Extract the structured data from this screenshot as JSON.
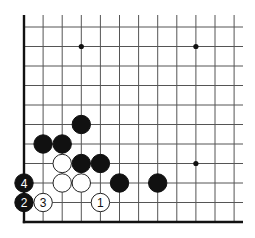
{
  "diagram": {
    "type": "go-board-fragment",
    "corner": "bottom-left",
    "columns_visible": 12,
    "rows_visible": 11,
    "grid": {
      "x0": 24,
      "dx": 19.1,
      "y0": 27,
      "dy": 19.5,
      "top_extent": 15,
      "right_extent": 243
    },
    "edges": [
      "left",
      "bottom"
    ],
    "star_points": [
      {
        "col": 3,
        "row": 1
      },
      {
        "col": 9,
        "row": 1
      },
      {
        "col": 9,
        "row": 7
      }
    ],
    "stones": [
      {
        "color": "black",
        "col": 3,
        "row": 5,
        "label": ""
      },
      {
        "color": "black",
        "col": 1,
        "row": 6,
        "label": ""
      },
      {
        "color": "black",
        "col": 2,
        "row": 6,
        "label": ""
      },
      {
        "color": "white",
        "col": 2,
        "row": 7,
        "label": ""
      },
      {
        "color": "black",
        "col": 3,
        "row": 7,
        "label": ""
      },
      {
        "color": "black",
        "col": 4,
        "row": 7,
        "label": ""
      },
      {
        "color": "black",
        "col": 0,
        "row": 8,
        "label": "4"
      },
      {
        "color": "white",
        "col": 2,
        "row": 8,
        "label": ""
      },
      {
        "color": "white",
        "col": 3,
        "row": 8,
        "label": ""
      },
      {
        "color": "black",
        "col": 5,
        "row": 8,
        "label": ""
      },
      {
        "color": "black",
        "col": 7,
        "row": 8,
        "label": ""
      },
      {
        "color": "black",
        "col": 0,
        "row": 9,
        "label": "2"
      },
      {
        "color": "white",
        "col": 1,
        "row": 9,
        "label": "3"
      },
      {
        "color": "white",
        "col": 4,
        "row": 9,
        "label": "1"
      }
    ],
    "move_sequence": [
      {
        "move": "1",
        "color": "white"
      },
      {
        "move": "2",
        "color": "black"
      },
      {
        "move": "3",
        "color": "white"
      },
      {
        "move": "4",
        "color": "black"
      }
    ],
    "colors": {
      "black_stone": "#111111",
      "white_stone": "#ffffff",
      "grid": "#555555",
      "edge": "#111111",
      "background": "#ffffff"
    }
  }
}
